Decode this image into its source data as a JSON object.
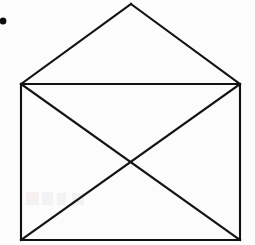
{
  "canvas": {
    "width": 255,
    "height": 245,
    "background_color": "#fcfcfc",
    "stroke_color": "#111111",
    "stroke_width": 2.1
  },
  "figure": {
    "name": "envelope",
    "body_rect": {
      "top_left": [
        21,
        84
      ],
      "top_right": [
        240,
        84
      ],
      "bottom_right": [
        240,
        240
      ],
      "bottom_left": [
        21,
        240
      ],
      "width": 219,
      "height": 156
    },
    "flap": {
      "apex": [
        131,
        4
      ],
      "left_base": [
        21,
        84
      ],
      "right_base": [
        240,
        84
      ]
    },
    "diagonals": [
      {
        "name": "diagonal-tl-br",
        "from": [
          21,
          84
        ],
        "to": [
          240,
          240
        ]
      },
      {
        "name": "diagonal-tr-bl",
        "from": [
          240,
          84
        ],
        "to": [
          21,
          240
        ]
      }
    ],
    "crossing_point": [
      131,
      162
    ]
  },
  "marks": {
    "corner_dot": {
      "label": "ink-dot",
      "center": [
        3,
        21
      ],
      "radius_x": 3.4,
      "radius_y": 3.6,
      "color": "#0d0d0d"
    },
    "ghost_artifacts": [
      {
        "label": "faint-bleed-mark-1",
        "x": 26,
        "y": 192,
        "width": 13,
        "height": 13,
        "color": "#b08a88"
      },
      {
        "label": "faint-bleed-mark-2",
        "x": 42,
        "y": 192,
        "width": 11,
        "height": 13,
        "color": "#9a8fa8"
      },
      {
        "label": "faint-bleed-mark-3",
        "x": 57,
        "y": 193,
        "width": 9,
        "height": 12,
        "color": "#a88f90"
      },
      {
        "label": "faint-bleed-mark-4",
        "x": 72,
        "y": 193,
        "width": 12,
        "height": 12,
        "color": "#94909f"
      }
    ]
  }
}
